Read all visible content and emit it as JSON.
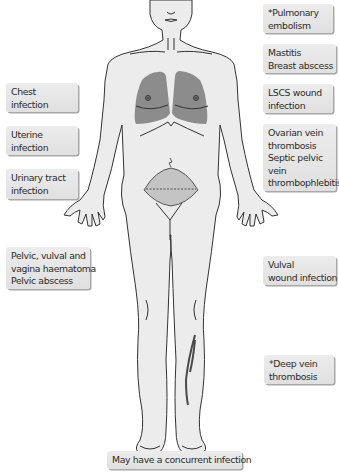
{
  "figure": {
    "type": "anatomical-diagram",
    "colors": {
      "body_fill": "#ececec",
      "outline": "#333333",
      "lungs_fill": "#8c8c8c",
      "uterus_fill": "#c4c4c4",
      "dvt_vein": "#4a4a4a",
      "box_fill": "#e4e4e4",
      "box_shadow": "#a8a8a8",
      "text": "#2b2b2b"
    }
  },
  "labels": {
    "left": [
      {
        "id": "chest",
        "lines": [
          "Chest",
          "infection"
        ]
      },
      {
        "id": "uterine",
        "lines": [
          "Uterine",
          "infection"
        ]
      },
      {
        "id": "uti",
        "lines": [
          "Urinary tract",
          "infection"
        ]
      },
      {
        "id": "pelvic",
        "lines": [
          "Pelvic, vulval and",
          "vagina haematoma",
          "Pelvic abscess"
        ]
      }
    ],
    "right": [
      {
        "id": "pe",
        "lines": [
          "*Pulmonary",
          "embolism"
        ]
      },
      {
        "id": "mastitis",
        "lines": [
          "Mastitis",
          "Breast abscess"
        ]
      },
      {
        "id": "lscs",
        "lines": [
          "LSCS wound",
          "infection"
        ]
      },
      {
        "id": "ovarian",
        "lines": [
          "Ovarian vein",
          "thrombosis",
          "Septic pelvic",
          "vein",
          "thrombophlebitis"
        ]
      },
      {
        "id": "vulval",
        "lines": [
          "Vulval",
          "wound infection"
        ]
      },
      {
        "id": "dvt",
        "lines": [
          "*Deep vein",
          "thrombosis"
        ]
      }
    ],
    "bottom": {
      "id": "concurrent",
      "text": "May have a concurrent infection"
    }
  }
}
